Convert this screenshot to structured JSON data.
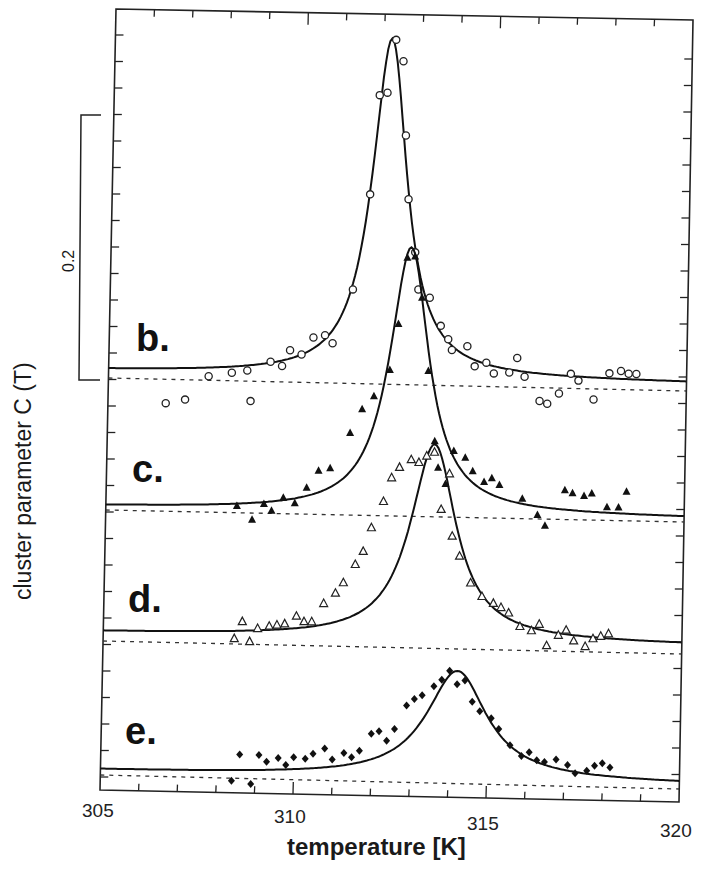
{
  "chart_data": {
    "type": "scatter",
    "title": "",
    "xlabel": "temperature [K]",
    "ylabel": "cluster parameter  C (T)",
    "scale_bar": {
      "label": "0.2",
      "value": 0.2
    },
    "xlim": [
      305,
      320
    ],
    "xticks": [
      305,
      310,
      315,
      320
    ],
    "xtick_labels": [
      "305",
      "310",
      "315",
      "320"
    ],
    "grid": false,
    "legend": null,
    "note": "Curves vertically offset; each has a dotted baseline. Solid line = fit, markers = data.",
    "series": [
      {
        "name": "b.",
        "marker": "open-circle",
        "peak_T": 312.2,
        "peak_height": 0.255,
        "width": 0.55,
        "fit_offset": 0.006,
        "baseline_px": [
          378,
          391
        ],
        "points": [
          [
            306.5,
            -0.018
          ],
          [
            307.0,
            -0.015
          ],
          [
            307.6,
            0.003
          ],
          [
            308.2,
            0.006
          ],
          [
            308.6,
            0.008
          ],
          [
            308.7,
            -0.015
          ],
          [
            309.2,
            0.015
          ],
          [
            309.5,
            0.012
          ],
          [
            309.7,
            0.024
          ],
          [
            310.0,
            0.021
          ],
          [
            310.3,
            0.034
          ],
          [
            310.6,
            0.036
          ],
          [
            310.8,
            0.03
          ],
          [
            311.3,
            0.071
          ],
          [
            311.7,
            0.143
          ],
          [
            311.9,
            0.218
          ],
          [
            312.1,
            0.22
          ],
          [
            312.3,
            0.26
          ],
          [
            312.5,
            0.244
          ],
          [
            312.6,
            0.188
          ],
          [
            312.7,
            0.14
          ],
          [
            312.9,
            0.1
          ],
          [
            313.0,
            0.072
          ],
          [
            313.3,
            0.066
          ],
          [
            313.6,
            0.045
          ],
          [
            313.8,
            0.035
          ],
          [
            313.9,
            0.027
          ],
          [
            314.3,
            0.03
          ],
          [
            314.5,
            0.015
          ],
          [
            314.8,
            0.018
          ],
          [
            315.0,
            0.01
          ],
          [
            315.4,
            0.011
          ],
          [
            315.6,
            0.022
          ],
          [
            315.8,
            0.008
          ],
          [
            316.2,
            -0.01
          ],
          [
            316.4,
            -0.012
          ],
          [
            316.7,
            -0.004
          ],
          [
            317.0,
            0.011
          ],
          [
            317.2,
            0.006
          ],
          [
            317.6,
            -0.008
          ],
          [
            318.0,
            0.012
          ],
          [
            318.3,
            0.014
          ],
          [
            318.5,
            0.012
          ],
          [
            318.7,
            0.012
          ]
        ]
      },
      {
        "name": "c.",
        "marker": "filled-triangle",
        "peak_T": 312.8,
        "peak_height": 0.2,
        "width": 0.62,
        "fit_offset": 0.003,
        "baseline_px": [
          510,
          522
        ],
        "points": [
          [
            308.4,
            0.005
          ],
          [
            308.8,
            -0.005
          ],
          [
            309.1,
            0.007
          ],
          [
            309.3,
            0.002
          ],
          [
            309.6,
            0.012
          ],
          [
            309.9,
            0.008
          ],
          [
            310.2,
            0.02
          ],
          [
            310.5,
            0.033
          ],
          [
            310.8,
            0.035
          ],
          [
            311.3,
            0.062
          ],
          [
            311.6,
            0.08
          ],
          [
            311.9,
            0.09
          ],
          [
            312.3,
            0.11
          ],
          [
            312.5,
            0.145
          ],
          [
            312.7,
            0.195
          ],
          [
            312.9,
            0.196
          ],
          [
            313.1,
            0.165
          ],
          [
            313.3,
            0.11
          ],
          [
            313.5,
            0.057
          ],
          [
            313.6,
            0.037
          ],
          [
            313.8,
            0.025
          ],
          [
            314.0,
            0.05
          ],
          [
            314.3,
            0.045
          ],
          [
            314.5,
            0.035
          ],
          [
            314.8,
            0.027
          ],
          [
            315.0,
            0.03
          ],
          [
            315.2,
            0.025
          ],
          [
            315.8,
            0.015
          ],
          [
            316.2,
            0.003
          ],
          [
            316.4,
            -0.005
          ],
          [
            316.9,
            0.022
          ],
          [
            317.1,
            0.02
          ],
          [
            317.4,
            0.018
          ],
          [
            317.6,
            0.02
          ],
          [
            318.0,
            0.01
          ],
          [
            318.3,
            0.01
          ],
          [
            318.5,
            0.022
          ]
        ]
      },
      {
        "name": "d.",
        "marker": "open-triangle",
        "peak_T": 313.5,
        "peak_height": 0.147,
        "width": 0.72,
        "fit_offset": 0.007,
        "baseline_px": [
          641,
          654
        ],
        "points": [
          [
            308.4,
            0.004
          ],
          [
            308.6,
            0.017
          ],
          [
            308.8,
            0.002
          ],
          [
            309.0,
            0.012
          ],
          [
            309.3,
            0.014
          ],
          [
            309.5,
            0.015
          ],
          [
            309.7,
            0.016
          ],
          [
            310.0,
            0.022
          ],
          [
            310.2,
            0.018
          ],
          [
            310.4,
            0.018
          ],
          [
            310.7,
            0.032
          ],
          [
            311.0,
            0.04
          ],
          [
            311.2,
            0.048
          ],
          [
            311.5,
            0.062
          ],
          [
            311.7,
            0.072
          ],
          [
            311.9,
            0.09
          ],
          [
            312.2,
            0.11
          ],
          [
            312.4,
            0.128
          ],
          [
            312.6,
            0.136
          ],
          [
            312.9,
            0.142
          ],
          [
            313.1,
            0.14
          ],
          [
            313.3,
            0.145
          ],
          [
            313.5,
            0.148
          ],
          [
            313.7,
            0.105
          ],
          [
            313.9,
            0.132
          ],
          [
            314.0,
            0.085
          ],
          [
            314.2,
            0.07
          ],
          [
            314.5,
            0.05
          ],
          [
            314.8,
            0.04
          ],
          [
            315.1,
            0.035
          ],
          [
            315.3,
            0.032
          ],
          [
            315.5,
            0.028
          ],
          [
            315.8,
            0.018
          ],
          [
            316.1,
            0.015
          ],
          [
            316.3,
            0.02
          ],
          [
            316.5,
            0.004
          ],
          [
            316.8,
            0.012
          ],
          [
            317.0,
            0.016
          ],
          [
            317.2,
            0.008
          ],
          [
            317.5,
            0.004
          ],
          [
            317.7,
            0.01
          ],
          [
            317.9,
            0.012
          ],
          [
            318.1,
            0.014
          ]
        ]
      },
      {
        "name": "e.",
        "marker": "filled-diamond",
        "peak_T": 314.2,
        "peak_height": 0.081,
        "width": 0.95,
        "fit_offset": 0.004,
        "baseline_px": [
          775,
          789
        ],
        "points": [
          [
            308.4,
            -0.002
          ],
          [
            308.6,
            0.018
          ],
          [
            308.9,
            -0.004
          ],
          [
            309.1,
            0.018
          ],
          [
            309.3,
            0.013
          ],
          [
            309.6,
            0.016
          ],
          [
            309.8,
            0.011
          ],
          [
            310.0,
            0.017
          ],
          [
            310.3,
            0.016
          ],
          [
            310.5,
            0.02
          ],
          [
            310.8,
            0.024
          ],
          [
            311.0,
            0.016
          ],
          [
            311.3,
            0.021
          ],
          [
            311.5,
            0.018
          ],
          [
            311.7,
            0.023
          ],
          [
            312.0,
            0.036
          ],
          [
            312.2,
            0.038
          ],
          [
            312.4,
            0.031
          ],
          [
            312.6,
            0.04
          ],
          [
            312.9,
            0.058
          ],
          [
            313.1,
            0.063
          ],
          [
            313.3,
            0.066
          ],
          [
            313.6,
            0.073
          ],
          [
            313.8,
            0.078
          ],
          [
            314.0,
            0.085
          ],
          [
            314.2,
            0.075
          ],
          [
            314.4,
            0.078
          ],
          [
            314.6,
            0.062
          ],
          [
            314.8,
            0.055
          ],
          [
            315.1,
            0.05
          ],
          [
            315.3,
            0.042
          ],
          [
            315.6,
            0.03
          ],
          [
            315.9,
            0.022
          ],
          [
            316.1,
            0.025
          ],
          [
            316.3,
            0.019
          ],
          [
            316.5,
            0.018
          ],
          [
            316.8,
            0.02
          ],
          [
            317.1,
            0.016
          ],
          [
            317.3,
            0.01
          ],
          [
            317.6,
            0.012
          ],
          [
            317.8,
            0.016
          ],
          [
            318.0,
            0.018
          ],
          [
            318.2,
            0.015
          ]
        ]
      }
    ]
  },
  "labels": {
    "ylabel": "cluster parameter   C (T)",
    "scale_bar": "0.2",
    "xlabel": "temperature [K]",
    "x305": "305",
    "x310": "310",
    "x315": "315",
    "x320": "320",
    "b": "b.",
    "c": "c.",
    "d": "d.",
    "e": "e."
  }
}
